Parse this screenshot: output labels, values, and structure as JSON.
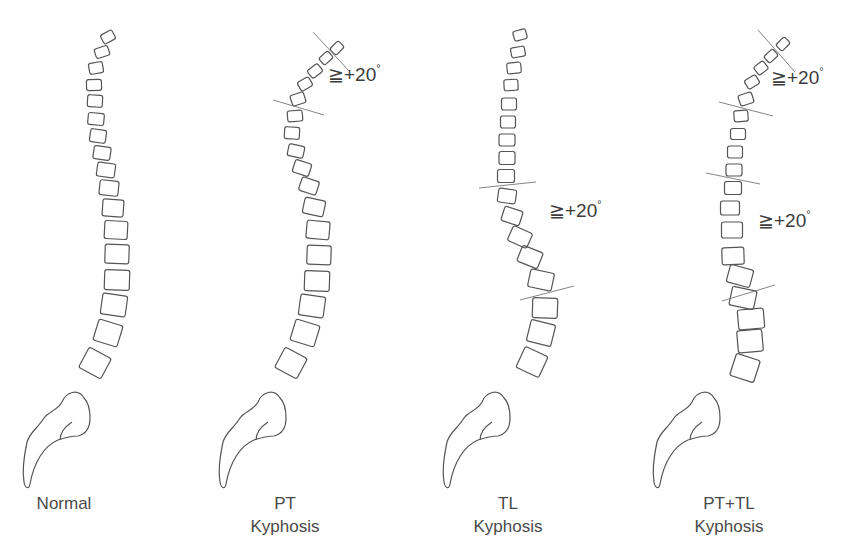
{
  "figure": {
    "stroke_color": "#555555",
    "line_color": "#777777",
    "text_color": "#4a4a4a",
    "background": "#ffffff",
    "panels": [
      {
        "id": "normal",
        "label_line1": "Normal",
        "label_line2": "",
        "label_x": 43,
        "label_y": 503,
        "vertebrae": [
          [
            108,
            37,
            13,
            10,
            -28
          ],
          [
            102,
            52,
            14,
            10,
            -18
          ],
          [
            96,
            68,
            14,
            11,
            -10
          ],
          [
            94,
            85,
            15,
            11,
            -2
          ],
          [
            95,
            101,
            15,
            12,
            3
          ],
          [
            96,
            119,
            16,
            12,
            5
          ],
          [
            98,
            136,
            16,
            13,
            8
          ],
          [
            102,
            153,
            17,
            13,
            8
          ],
          [
            106,
            170,
            18,
            14,
            8
          ],
          [
            109,
            188,
            19,
            15,
            6
          ],
          [
            113,
            208,
            21,
            17,
            4
          ],
          [
            116,
            230,
            23,
            18,
            3
          ],
          [
            117,
            254,
            24,
            19,
            2
          ],
          [
            117,
            280,
            25,
            20,
            2
          ],
          [
            114,
            305,
            25,
            21,
            8
          ],
          [
            108,
            333,
            25,
            22,
            17
          ],
          [
            95,
            363,
            25,
            23,
            28
          ]
        ],
        "sacrum_dx": 0,
        "cut_lines": [],
        "angle_labels": []
      },
      {
        "id": "pt-kyphosis",
        "label_line1": "PT",
        "label_line2": "Kyphosis",
        "label_x": 171,
        "label_y": 503,
        "vertebrae": [
          [
            337,
            48,
            12,
            9,
            -45
          ],
          [
            326,
            58,
            12,
            9,
            -42
          ],
          [
            315,
            71,
            13,
            10,
            -38
          ],
          [
            305,
            84,
            13,
            10,
            -30
          ],
          [
            298,
            99,
            14,
            11,
            -18
          ],
          [
            295,
            116,
            15,
            11,
            -5
          ],
          [
            292,
            133,
            15,
            12,
            3
          ],
          [
            296,
            151,
            16,
            12,
            12
          ],
          [
            302,
            168,
            17,
            13,
            18
          ],
          [
            309,
            186,
            18,
            14,
            18
          ],
          [
            314,
            207,
            21,
            16,
            12
          ],
          [
            318,
            230,
            23,
            18,
            5
          ],
          [
            319,
            255,
            24,
            19,
            2
          ],
          [
            317,
            281,
            25,
            20,
            2
          ],
          [
            312,
            306,
            25,
            21,
            8
          ],
          [
            305,
            333,
            25,
            22,
            17
          ],
          [
            291,
            363,
            25,
            23,
            28
          ]
        ],
        "sacrum_dx": 196,
        "cut_lines": [
          [
            313,
            32,
            350,
            72
          ],
          [
            273,
            100,
            324,
            115
          ]
        ],
        "angle_labels": [
          {
            "text": "≧+20",
            "x": 328,
            "y": 82
          }
        ]
      },
      {
        "id": "tl-kyphosis",
        "label_line1": "TL",
        "label_line2": "Kyphosis",
        "label_x": 307,
        "label_y": 503,
        "vertebrae": [
          [
            520,
            35,
            13,
            10,
            -15
          ],
          [
            518,
            52,
            14,
            10,
            -10
          ],
          [
            514,
            68,
            14,
            11,
            -6
          ],
          [
            511,
            85,
            14,
            11,
            -3
          ],
          [
            509,
            104,
            15,
            12,
            0
          ],
          [
            508,
            122,
            15,
            12,
            0
          ],
          [
            507,
            140,
            16,
            12,
            0
          ],
          [
            507,
            158,
            16,
            13,
            0
          ],
          [
            506,
            176,
            17,
            13,
            0
          ],
          [
            507,
            196,
            18,
            14,
            8
          ],
          [
            512,
            216,
            19,
            15,
            18
          ],
          [
            520,
            237,
            21,
            16,
            24
          ],
          [
            530,
            257,
            22,
            17,
            22
          ],
          [
            541,
            280,
            24,
            18,
            12
          ],
          [
            545,
            308,
            25,
            20,
            2
          ],
          [
            541,
            333,
            25,
            22,
            14
          ],
          [
            532,
            362,
            25,
            23,
            25
          ]
        ],
        "sacrum_dx": 420,
        "cut_lines": [
          [
            479,
            188,
            536,
            182
          ],
          [
            520,
            300,
            574,
            286
          ]
        ],
        "angle_labels": [
          {
            "text": "≧+20",
            "x": 549,
            "y": 218
          }
        ]
      },
      {
        "id": "pt-tl-kyphosis",
        "label_line1": "PT+TL",
        "label_line2": "Kyphosis",
        "label_x": 440,
        "label_y": 503,
        "vertebrae": [
          [
            783,
            44,
            12,
            9,
            -45
          ],
          [
            771,
            56,
            12,
            9,
            -42
          ],
          [
            761,
            68,
            12,
            10,
            -38
          ],
          [
            752,
            82,
            13,
            10,
            -32
          ],
          [
            746,
            99,
            14,
            11,
            -18
          ],
          [
            741,
            116,
            14,
            11,
            -5
          ],
          [
            738,
            134,
            15,
            11,
            0
          ],
          [
            735,
            152,
            15,
            12,
            0
          ],
          [
            734,
            170,
            16,
            12,
            0
          ],
          [
            733,
            188,
            17,
            13,
            0
          ],
          [
            730,
            208,
            19,
            14,
            0
          ],
          [
            732,
            230,
            21,
            16,
            0
          ],
          [
            733,
            256,
            22,
            17,
            -2
          ],
          [
            740,
            276,
            24,
            18,
            15
          ],
          [
            743,
            298,
            25,
            19,
            12
          ],
          [
            751,
            319,
            26,
            20,
            -5
          ],
          [
            750,
            341,
            25,
            22,
            -5
          ],
          [
            745,
            368,
            25,
            23,
            18
          ]
        ],
        "sacrum_dx": 630,
        "cut_lines": [
          [
            758,
            30,
            795,
            72
          ],
          [
            719,
            102,
            773,
            116
          ],
          [
            706,
            173,
            760,
            184
          ],
          [
            722,
            301,
            775,
            285
          ]
        ],
        "angle_labels": [
          {
            "text": "≧+20",
            "x": 771,
            "y": 85
          },
          {
            "text": "≧+20",
            "x": 758,
            "y": 228
          }
        ]
      }
    ]
  }
}
